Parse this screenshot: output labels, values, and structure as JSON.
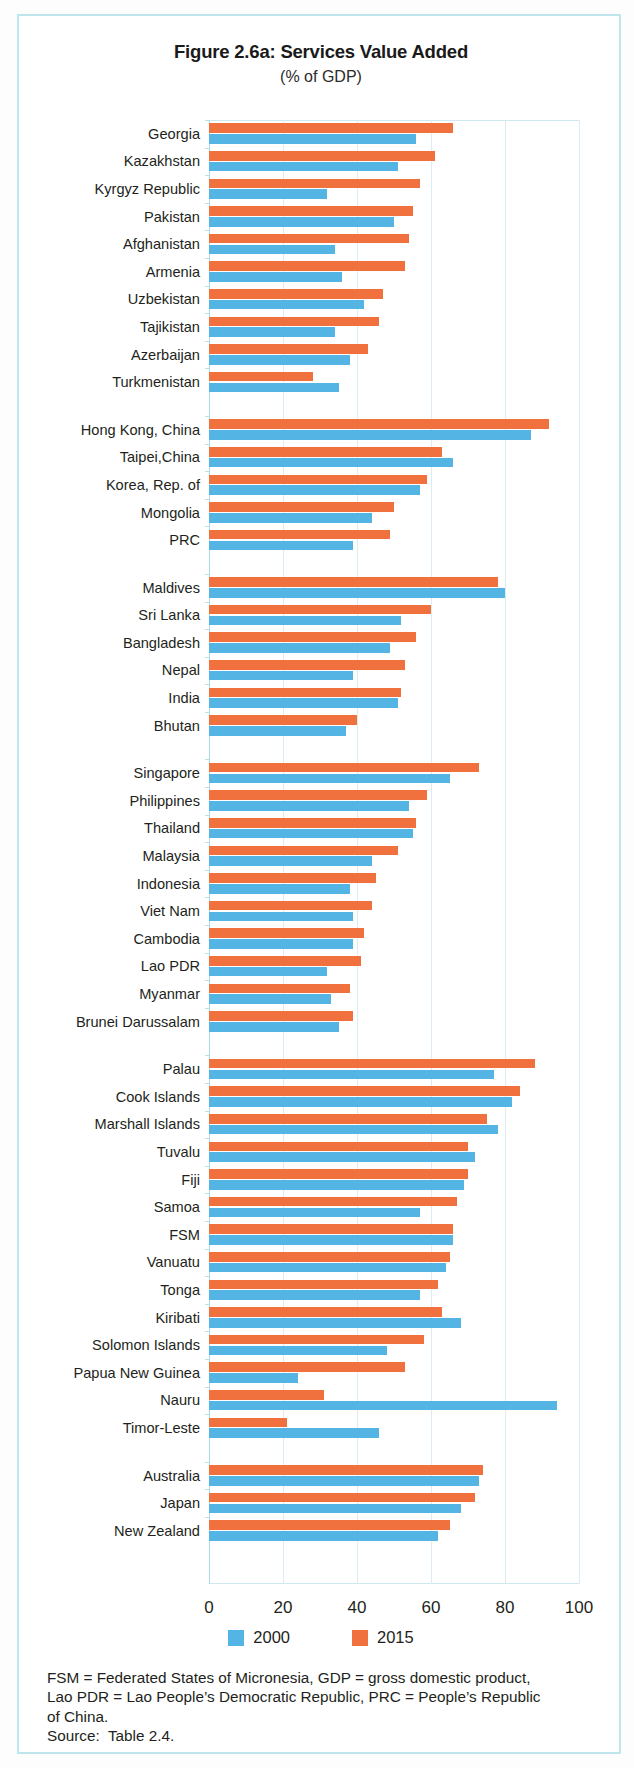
{
  "figure": {
    "title": "Figure 2.6a:  Services Value Added",
    "subtitle": "(% of GDP)"
  },
  "legend": {
    "items": [
      {
        "label": "2000",
        "color": "#54b4e4"
      },
      {
        "label": "2015",
        "color": "#f0713e"
      }
    ]
  },
  "axis": {
    "ticks": [
      "0",
      "20",
      "40",
      "60",
      "80",
      "100"
    ]
  },
  "footnote": {
    "line1": "FSM = Federated States of Micronesia, GDP = gross domestic product,",
    "line2": "Lao PDR = Lao People’s Democratic Republic, PRC = People’s Republic",
    "line3": "of China.",
    "line4": "Source:  Table 2.4."
  },
  "chart_data": {
    "type": "bar",
    "orientation": "horizontal",
    "title": "Figure 2.6a:  Services Value Added",
    "subtitle": "(% of GDP)",
    "xlabel": "% of GDP",
    "ylabel": "",
    "xlim": [
      0,
      100
    ],
    "xticks": [
      0,
      20,
      40,
      60,
      80,
      100
    ],
    "grid": true,
    "legend_position": "bottom",
    "series": [
      {
        "name": "2000",
        "color": "#54b4e4"
      },
      {
        "name": "2015",
        "color": "#f0713e"
      }
    ],
    "groups": [
      {
        "name": "Central and West Asia",
        "categories": [
          "Georgia",
          "Kazakhstan",
          "Kyrgyz Republic",
          "Pakistan",
          "Afghanistan",
          "Armenia",
          "Uzbekistan",
          "Tajikistan",
          "Azerbaijan",
          "Turkmenistan"
        ],
        "values_2000": [
          56,
          51,
          32,
          50,
          34,
          36,
          42,
          34,
          38,
          35
        ],
        "values_2015": [
          66,
          61,
          57,
          55,
          54,
          53,
          47,
          46,
          43,
          28
        ]
      },
      {
        "name": "East Asia",
        "categories": [
          "Hong Kong, China",
          "Taipei,China",
          "Korea, Rep. of",
          "Mongolia",
          "PRC"
        ],
        "values_2000": [
          87,
          66,
          57,
          44,
          39
        ],
        "values_2015": [
          92,
          63,
          59,
          50,
          49
        ]
      },
      {
        "name": "South Asia",
        "categories": [
          "Maldives",
          "Sri Lanka",
          "Bangladesh",
          "Nepal",
          "India",
          "Bhutan"
        ],
        "values_2000": [
          80,
          52,
          49,
          39,
          51,
          37
        ],
        "values_2015": [
          78,
          60,
          56,
          53,
          52,
          40
        ]
      },
      {
        "name": "Southeast Asia",
        "categories": [
          "Singapore",
          "Philippines",
          "Thailand",
          "Malaysia",
          "Indonesia",
          "Viet Nam",
          "Cambodia",
          "Lao PDR",
          "Myanmar",
          "Brunei Darussalam"
        ],
        "values_2000": [
          65,
          54,
          55,
          44,
          38,
          39,
          39,
          32,
          33,
          35
        ],
        "values_2015": [
          73,
          59,
          56,
          51,
          45,
          44,
          42,
          41,
          38,
          39
        ]
      },
      {
        "name": "The Pacific",
        "categories": [
          "Palau",
          "Cook Islands",
          "Marshall Islands",
          "Tuvalu",
          "Fiji",
          "Samoa",
          "FSM",
          "Vanuatu",
          "Tonga",
          "Kiribati",
          "Solomon Islands",
          "Papua New Guinea",
          "Nauru",
          "Timor-Leste"
        ],
        "values_2000": [
          77,
          82,
          78,
          72,
          69,
          57,
          66,
          64,
          57,
          68,
          48,
          24,
          94,
          46
        ],
        "values_2015": [
          88,
          84,
          75,
          70,
          70,
          67,
          66,
          65,
          62,
          63,
          58,
          53,
          31,
          21
        ]
      },
      {
        "name": "Developed Economies",
        "categories": [
          "Australia",
          "Japan",
          "New Zealand"
        ],
        "values_2000": [
          73,
          68,
          62
        ],
        "values_2015": [
          74,
          72,
          65
        ]
      }
    ]
  }
}
